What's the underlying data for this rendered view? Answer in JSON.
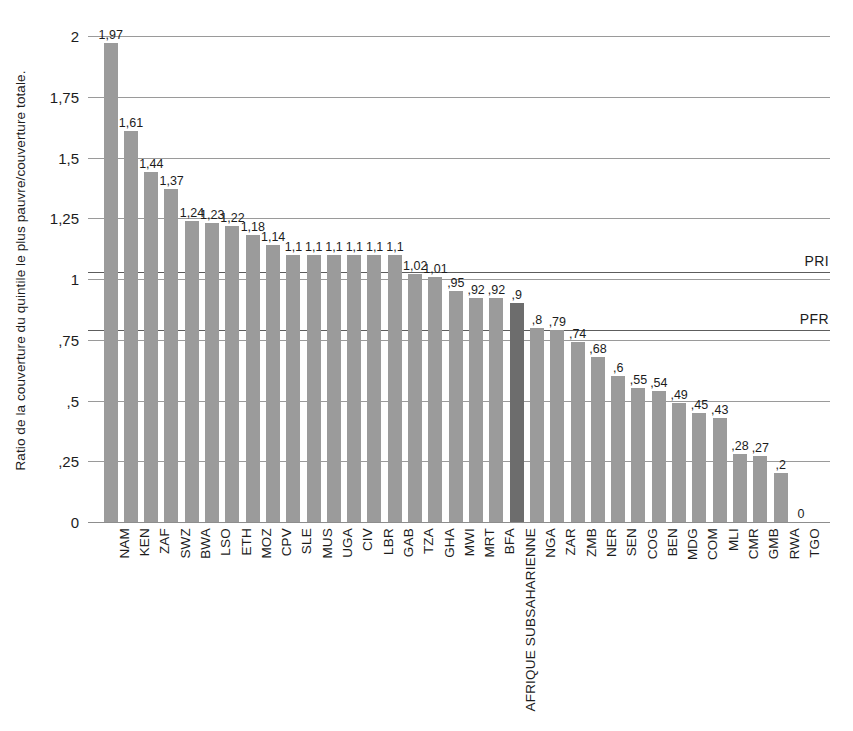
{
  "chart_data": {
    "type": "bar",
    "title": "",
    "subtitle": "",
    "xlabel": "",
    "ylabel": "Ratio de la couverture du quintile le plus pauvre/couverture totale.",
    "ylim": [
      0,
      2
    ],
    "yticks": [
      {
        "value": 2,
        "label": "2"
      },
      {
        "value": 1.75,
        "label": "1,75"
      },
      {
        "value": 1.5,
        "label": "1,5"
      },
      {
        "value": 1.25,
        "label": "1,25"
      },
      {
        "value": 1,
        "label": "1"
      },
      {
        "value": 0.75,
        "label": ",75"
      },
      {
        "value": 0.5,
        "label": ",5"
      },
      {
        "value": 0.25,
        "label": ",25"
      },
      {
        "value": 0,
        "label": "0"
      }
    ],
    "grid": true,
    "legend_position": "none",
    "categories": [
      "NAM",
      "KEN",
      "ZAF",
      "SWZ",
      "BWA",
      "LSO",
      "ETH",
      "MOZ",
      "CPV",
      "SLE",
      "MUS",
      "UGA",
      "CIV",
      "LBR",
      "GAB",
      "TZA",
      "GHA",
      "MWI",
      "MRT",
      "BFA",
      "AFRIQUE SUBSAHARIENNE",
      "NGA",
      "ZAR",
      "ZMB",
      "NER",
      "SEN",
      "COG",
      "BEN",
      "MDG",
      "COM",
      "MLI",
      "CMR",
      "GMB",
      "RWA",
      "TGO"
    ],
    "values": [
      1.97,
      1.61,
      1.44,
      1.37,
      1.24,
      1.23,
      1.22,
      1.18,
      1.14,
      1.1,
      1.1,
      1.1,
      1.1,
      1.1,
      1.1,
      1.02,
      1.01,
      0.95,
      0.92,
      0.92,
      0.9,
      0.8,
      0.79,
      0.74,
      0.68,
      0.6,
      0.55,
      0.54,
      0.49,
      0.45,
      0.43,
      0.28,
      0.27,
      0.2,
      0
    ],
    "value_labels": [
      "1,97",
      "1,61",
      "1,44",
      "1,37",
      "1,24",
      "1,23",
      "1,22",
      "1,18",
      "1,14",
      "1,1",
      "1,1",
      "1,1",
      "1,1",
      "1,1",
      "1,1",
      "1,02",
      "1,01",
      ",95",
      ",92",
      ",92",
      ",9",
      ",8",
      ",79",
      ",74",
      ",68",
      ",6",
      ",55",
      ",54",
      ",49",
      ",45",
      ",43",
      ",28",
      ",27",
      ",2",
      "0"
    ],
    "highlight_index": 20,
    "colors": {
      "bar": "#9b9b9b",
      "bar_highlight": "#6d6d6d",
      "gridline": "#9a9a9a",
      "refline": "#5d5d5d",
      "text": "#1c1c1c",
      "background": "#ffffff"
    },
    "reference_lines": [
      {
        "label": "PRI",
        "value": 1.03
      },
      {
        "label": "PFR",
        "value": 0.79
      }
    ]
  }
}
